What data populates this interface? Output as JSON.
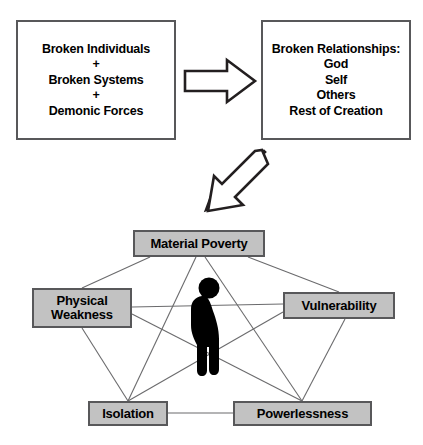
{
  "diagram": {
    "type": "concept-flow-diagram",
    "colors": {
      "node_fill": "#c2c2c2",
      "box_fill": "#ffffff",
      "border": "#58585a",
      "text": "#000000",
      "figure": "#000000",
      "connector": "#58585a"
    }
  },
  "causes_box": {
    "lines": [
      {
        "text": "Broken Individuals",
        "kind": "item"
      },
      {
        "text": "+",
        "kind": "plus"
      },
      {
        "text": "Broken Systems",
        "kind": "item"
      },
      {
        "text": "+",
        "kind": "plus"
      },
      {
        "text": "Demonic Forces",
        "kind": "item"
      }
    ]
  },
  "effects_box": {
    "lines": [
      {
        "text": "Broken Relationships:",
        "kind": "heading"
      },
      {
        "text": "God",
        "kind": "item"
      },
      {
        "text": "Self",
        "kind": "item"
      },
      {
        "text": "Others",
        "kind": "item"
      },
      {
        "text": "Rest of Creation",
        "kind": "item"
      }
    ]
  },
  "arrows": [
    {
      "name": "right-arrow-icon",
      "direction": "right",
      "from": "causes_box",
      "to": "effects_box"
    },
    {
      "name": "down-left-arrow-icon",
      "direction": "down-left",
      "from": "effects_box",
      "to": "network"
    }
  ],
  "network": {
    "figure_label": "hunched-person-silhouette",
    "nodes": [
      {
        "id": "material",
        "label": "Material Poverty"
      },
      {
        "id": "physical",
        "label": "Physical\nWeakness"
      },
      {
        "id": "vulnerability",
        "label": "Vulnerability"
      },
      {
        "id": "isolation",
        "label": "Isolation"
      },
      {
        "id": "powerlessness",
        "label": "Powerlessness"
      }
    ],
    "edges": [
      {
        "from": "material",
        "to": "physical"
      },
      {
        "from": "material",
        "to": "vulnerability"
      },
      {
        "from": "material",
        "to": "isolation"
      },
      {
        "from": "material",
        "to": "powerlessness"
      },
      {
        "from": "physical",
        "to": "vulnerability"
      },
      {
        "from": "physical",
        "to": "isolation"
      },
      {
        "from": "physical",
        "to": "powerlessness"
      },
      {
        "from": "vulnerability",
        "to": "isolation"
      },
      {
        "from": "vulnerability",
        "to": "powerlessness"
      },
      {
        "from": "isolation",
        "to": "powerlessness"
      }
    ]
  }
}
